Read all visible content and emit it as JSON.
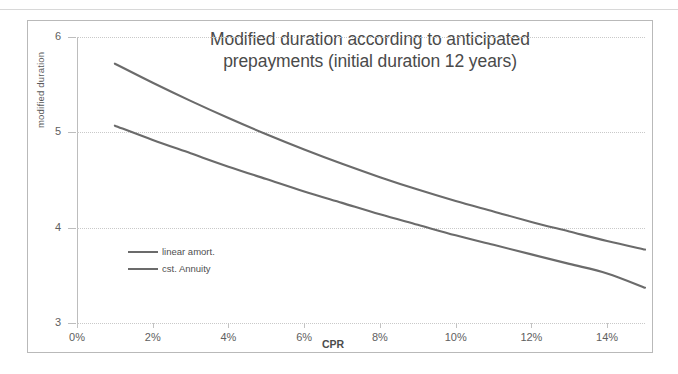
{
  "page": {
    "background": "#ffffff",
    "top_rule_color": "#d8d8d8",
    "frame_color": "#b9b9b9"
  },
  "chart_data": {
    "type": "line",
    "title": "Modified duration according to anticipated prepayments (initial duration 12 years)",
    "title_line1": "Modified duration according to anticipated",
    "title_line2": "prepayments (initial duration 12 years)",
    "xlabel": "CPR",
    "ylabel": "modified duration",
    "xlim": [
      0,
      15
    ],
    "ylim": [
      3,
      6
    ],
    "grid": true,
    "grid_axis": "y",
    "legend_position": "inside-lower-left",
    "x_tick_labels": [
      "0%",
      "2%",
      "4%",
      "6%",
      "8%",
      "10%",
      "12%",
      "14%"
    ],
    "x_tick_values": [
      0,
      2,
      4,
      6,
      8,
      10,
      12,
      14
    ],
    "y_tick_labels": [
      "3",
      "4",
      "5",
      "6"
    ],
    "y_tick_values": [
      3,
      4,
      5,
      6
    ],
    "line_color": "#6b6b6b",
    "x": [
      1,
      2,
      3,
      4,
      5,
      6,
      7,
      8,
      9,
      10,
      11,
      12,
      13,
      14,
      15
    ],
    "series": [
      {
        "name": "linear amort.",
        "values": [
          5.72,
          5.52,
          5.33,
          5.15,
          4.98,
          4.82,
          4.67,
          4.53,
          4.4,
          4.28,
          4.17,
          4.06,
          3.96,
          3.86,
          3.77
        ]
      },
      {
        "name": "cst. Annuity",
        "values": [
          5.07,
          4.92,
          4.78,
          4.64,
          4.51,
          4.38,
          4.26,
          4.14,
          4.03,
          3.92,
          3.82,
          3.72,
          3.62,
          3.52,
          3.37
        ]
      }
    ]
  }
}
